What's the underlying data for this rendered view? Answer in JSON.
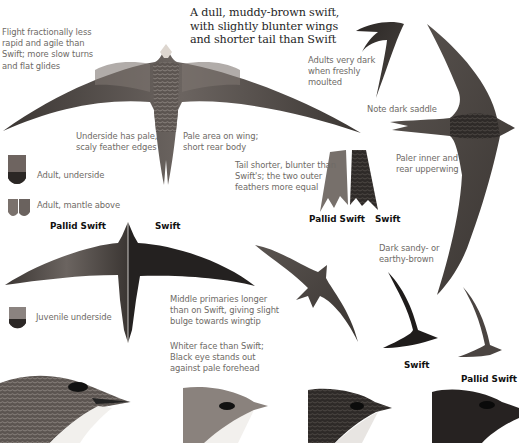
{
  "page": {
    "title_text": "A dull, muddy-brown swift,\nwith slightly blunter wings\nand shorter tail than Swift",
    "captions": {
      "flight": "Flight fractionally less\nrapid and agile than\nSwift; more slow turns\nand flat glides",
      "adults_dark": "Adults very dark\nwhen freshly\nmoulted",
      "dark_saddle": "Note dark saddle",
      "underside_scaly": "Underside has pale,\nscaly feather edges",
      "pale_area": "Pale area on wing;\nshort rear body",
      "tail_shorter": "Tail shorter, blunter than\nSwift's; the two outer\nfeathers more equal",
      "paler_inner": "Paler inner and\nrear upperwing",
      "adult_underside": "Adult, underside",
      "adult_mantle": "Adult, mantle above",
      "dark_sandy": "Dark sandy- or\nearthy-brown",
      "middle_primaries": "Middle primaries longer\nthan on Swift, giving slight\nbulge towards wingtip",
      "juvenile_underside": "Juvenile underside",
      "whiter_face": "Whiter face than Swift;\nBlack eye stands out\nagainst pale forehead"
    },
    "labels": {
      "tail_pallid": "Pallid Swift",
      "tail_swift": "Swift",
      "split_pallid": "Pallid Swift",
      "split_swift": "Swift",
      "silhouette_swift": "Swift",
      "silhouette_pallid": "Pallid Swift"
    }
  }
}
